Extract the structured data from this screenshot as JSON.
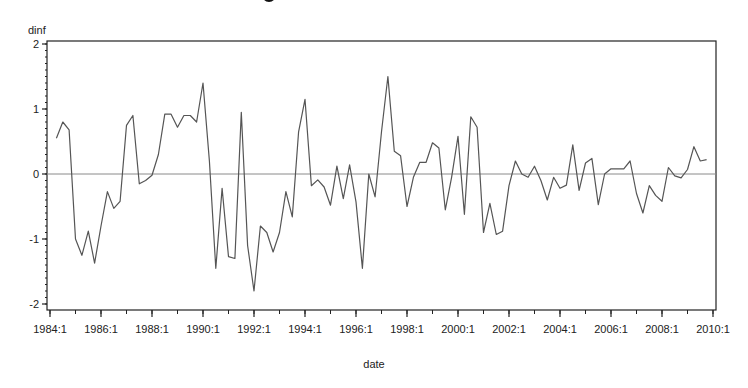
{
  "chart_data": {
    "type": "line",
    "title": "",
    "xlabel": "date",
    "ylabel": "dinf",
    "ylim": [
      -2,
      2
    ],
    "yticks": [
      2,
      1,
      0,
      -1,
      -2
    ],
    "xticks": [
      "1984:1",
      "1986:1",
      "1988:1",
      "1990:1",
      "1992:1",
      "1994:1",
      "1996:1",
      "1998:1",
      "2000:1",
      "2002:1",
      "2004:1",
      "2006:1",
      "2008:1",
      "2010:1"
    ],
    "x_range": [
      "1984:1",
      "2010:1"
    ],
    "grid": false,
    "reference_line": 0,
    "legend": null,
    "series": [
      {
        "name": "dinf",
        "start": "1984:2",
        "frequency": "quarterly",
        "values": [
          0.55,
          0.8,
          0.68,
          -1.0,
          -1.25,
          -0.88,
          -1.37,
          -0.8,
          -0.27,
          -0.53,
          -0.42,
          0.75,
          0.9,
          -0.15,
          -0.1,
          -0.02,
          0.3,
          0.92,
          0.92,
          0.72,
          0.9,
          0.9,
          0.8,
          1.4,
          0.2,
          -1.45,
          -0.22,
          -1.27,
          -1.3,
          0.95,
          -1.1,
          -1.8,
          -0.8,
          -0.9,
          -1.2,
          -0.9,
          -0.27,
          -0.66,
          0.65,
          1.15,
          -0.18,
          -0.09,
          -0.2,
          -0.48,
          0.12,
          -0.38,
          0.14,
          -0.43,
          -1.45,
          0.0,
          -0.35,
          0.65,
          1.5,
          0.35,
          0.28,
          -0.5,
          -0.05,
          0.18,
          0.18,
          0.48,
          0.4,
          -0.55,
          -0.05,
          0.58,
          -0.62,
          0.88,
          0.72,
          -0.9,
          -0.45,
          -0.93,
          -0.88,
          -0.18,
          0.2,
          0.0,
          -0.05,
          0.12,
          -0.1,
          -0.4,
          -0.05,
          -0.22,
          -0.17,
          0.45,
          -0.25,
          0.17,
          0.24,
          -0.47,
          0.0,
          0.08,
          0.08,
          0.08,
          0.2,
          -0.3,
          -0.6,
          -0.18,
          -0.33,
          -0.42,
          0.1,
          -0.03,
          -0.06,
          0.07,
          0.42,
          0.2,
          0.22
        ]
      }
    ]
  },
  "labels": {
    "ylabel": "dinf",
    "xlabel": "date"
  },
  "colors": {
    "line": "#555555",
    "zero_line": "#8a8a8a",
    "axis": "#222222"
  }
}
